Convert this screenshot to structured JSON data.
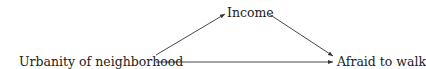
{
  "diagram": {
    "type": "causal-dag",
    "nodes": [
      {
        "id": "urbanity",
        "label": "Urbanity of neighborhood"
      },
      {
        "id": "income",
        "label": "Income"
      },
      {
        "id": "afraid",
        "label": "Afraid to walk"
      }
    ],
    "edges": [
      {
        "from": "urbanity",
        "to": "income"
      },
      {
        "from": "income",
        "to": "afraid"
      },
      {
        "from": "urbanity",
        "to": "afraid"
      }
    ],
    "colors": {
      "line": "#333333",
      "text": "#222222",
      "background": "#ffffff"
    }
  }
}
